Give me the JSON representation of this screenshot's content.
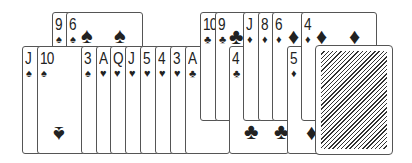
{
  "cards": [
    {
      "id": "9s",
      "rank": "9",
      "suit": "♠",
      "x": 52,
      "y": 12,
      "w": 50,
      "h": 109,
      "big": []
    },
    {
      "id": "6s",
      "rank": "6",
      "suit": "♠",
      "x": 66,
      "y": 12,
      "w": 77,
      "h": 109,
      "big": [
        {
          "g": "♠",
          "x": 14,
          "y": 12
        },
        {
          "g": "♠",
          "x": 47,
          "y": 12
        },
        {
          "g": "♠",
          "x": 13,
          "y": 103,
          "flip": true
        }
      ]
    },
    {
      "id": "Js",
      "rank": "J",
      "suit": "♠",
      "x": 22,
      "y": 46,
      "w": 60,
      "h": 108,
      "big": []
    },
    {
      "id": "10s",
      "rank": "10",
      "suit": "♠",
      "x": 37,
      "y": 46,
      "w": 60,
      "h": 108,
      "big": [
        {
          "g": "♠",
          "x": 15,
          "y": 76,
          "flip": true
        }
      ]
    },
    {
      "id": "3s",
      "rank": "3",
      "suit": "♠",
      "x": 81,
      "y": 46,
      "w": 40,
      "h": 108,
      "big": []
    },
    {
      "id": "Ah",
      "rank": "A",
      "suit": "♥",
      "x": 96,
      "y": 46,
      "w": 40,
      "h": 108,
      "big": []
    },
    {
      "id": "Qh",
      "rank": "Q",
      "suit": "♥",
      "x": 110,
      "y": 46,
      "w": 40,
      "h": 108,
      "big": []
    },
    {
      "id": "Jh",
      "rank": "J",
      "suit": "♥",
      "x": 125,
      "y": 46,
      "w": 40,
      "h": 108,
      "big": []
    },
    {
      "id": "5h",
      "rank": "5",
      "suit": "♥",
      "x": 140,
      "y": 46,
      "w": 40,
      "h": 108,
      "big": []
    },
    {
      "id": "4h",
      "rank": "4",
      "suit": "♥",
      "x": 155,
      "y": 46,
      "w": 40,
      "h": 108,
      "big": []
    },
    {
      "id": "3h",
      "rank": "3",
      "suit": "♥",
      "x": 170,
      "y": 46,
      "w": 40,
      "h": 108,
      "big": []
    },
    {
      "id": "Ac",
      "rank": "A",
      "suit": "♣",
      "x": 185,
      "y": 46,
      "w": 45,
      "h": 108,
      "big": []
    },
    {
      "id": "10c",
      "rank": "10",
      "suit": "♣",
      "x": 200,
      "y": 12,
      "w": 40,
      "h": 109,
      "big": []
    },
    {
      "id": "9c",
      "rank": "9",
      "suit": "♣",
      "x": 215,
      "y": 12,
      "w": 40,
      "h": 109,
      "big": [
        {
          "g": "♣",
          "x": 13,
          "y": 13
        }
      ]
    },
    {
      "id": "4c",
      "rank": "4",
      "suit": "♣",
      "x": 229,
      "y": 46,
      "w": 60,
      "h": 108,
      "big": [
        {
          "g": "♣",
          "x": 14,
          "y": 74
        },
        {
          "g": "♣",
          "x": 44,
          "y": 74
        }
      ]
    },
    {
      "id": "Jd",
      "rank": "J",
      "suit": "♦",
      "x": 243,
      "y": 12,
      "w": 30,
      "h": 109,
      "big": []
    },
    {
      "id": "8d",
      "rank": "8",
      "suit": "♦",
      "x": 258,
      "y": 12,
      "w": 30,
      "h": 109,
      "big": []
    },
    {
      "id": "6d",
      "rank": "6",
      "suit": "♦",
      "x": 272,
      "y": 12,
      "w": 40,
      "h": 109,
      "big": [
        {
          "g": "♦",
          "x": 15,
          "y": 13
        }
      ]
    },
    {
      "id": "5d",
      "rank": "5",
      "suit": "♦",
      "x": 287,
      "y": 46,
      "w": 40,
      "h": 108,
      "big": [
        {
          "g": "♦",
          "x": 18,
          "y": 75
        }
      ]
    },
    {
      "id": "4d",
      "rank": "4",
      "suit": "♦",
      "x": 301,
      "y": 12,
      "w": 76,
      "h": 109,
      "big": [
        {
          "g": "♦",
          "x": 14,
          "y": 13
        },
        {
          "g": "♦",
          "x": 47,
          "y": 13
        }
      ]
    }
  ],
  "deck": {
    "x": 316,
    "y": 46,
    "w": 76,
    "h": 108
  }
}
